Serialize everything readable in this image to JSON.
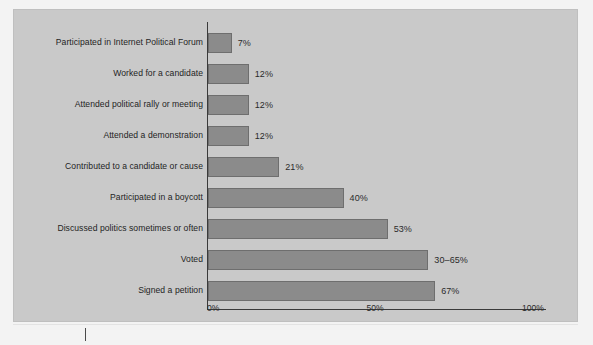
{
  "chart_data": {
    "type": "bar",
    "orientation": "horizontal",
    "title": "",
    "xlabel": "",
    "ylabel": "",
    "xlim": [
      0,
      100
    ],
    "grid": false,
    "legend": false,
    "categories": [
      "Participated in Internet Political Forum",
      "Worked for a candidate",
      "Attended political rally or meeting",
      "Attended a demonstration",
      "Contributed to a candidate or cause",
      "Participated in a boycott",
      "Discussed politics sometimes or often",
      "Voted",
      "Signed a petition"
    ],
    "values": [
      7,
      12,
      12,
      12,
      21,
      40,
      53,
      65,
      67
    ],
    "value_labels": [
      "7%",
      "12%",
      "12%",
      "12%",
      "21%",
      "40%",
      "53%",
      "30–65%",
      "67%"
    ],
    "xticks": [
      0,
      50,
      100
    ],
    "xtick_labels": [
      "0%",
      "50%",
      "100%"
    ]
  },
  "style": {
    "bar_fill": "#8b8b8b",
    "bar_stroke": "#6e6e6e",
    "panel_bg": "#c9c9c9",
    "page_bg": "#f3f3f3",
    "axis_color": "#3a3a3a",
    "text_color": "#1f1f1f"
  }
}
